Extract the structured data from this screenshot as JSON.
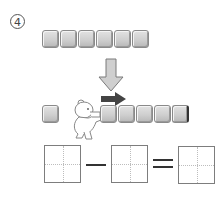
{
  "problem": {
    "number_label": "4",
    "top_row": {
      "block_count": 6
    },
    "bottom_row": {
      "left_block_count": 1,
      "right_block_count": 5
    },
    "equation": {
      "operator_1": "minus",
      "operator_2": "equals",
      "answer_boxes": [
        "",
        "",
        ""
      ]
    }
  },
  "colors": {
    "block_light": "#e2e2e2",
    "block_dark": "#b8b8b8",
    "block_border": "#8a8a8a",
    "down_arrow_fill": "#c8c8c8",
    "right_arrow_fill": "#444444",
    "box_border": "#7d7d7d",
    "guide_line": "#bdbdbd"
  }
}
